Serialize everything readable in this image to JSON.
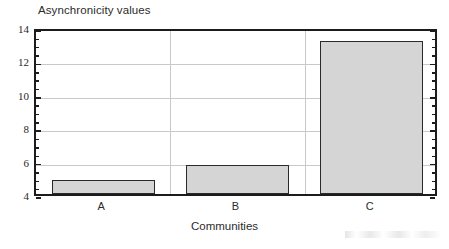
{
  "chart_data": {
    "type": "bar",
    "title": "Asynchronicity values",
    "xlabel": "Communities",
    "ylabel": "",
    "categories": [
      "A",
      "B",
      "C"
    ],
    "values": [
      4.85,
      5.75,
      13.15
    ],
    "series": [
      {
        "name": "Asynchronicity values",
        "values": [
          4.85,
          5.75,
          13.15
        ]
      }
    ],
    "ylim": [
      4,
      14
    ],
    "xlim": [
      0,
      3
    ],
    "y_ticks": [
      4,
      6,
      8,
      10,
      12,
      14
    ],
    "y_tick_labels": [
      "4",
      "6",
      "8",
      "10",
      "12",
      "14"
    ],
    "y_minor_ticks": [
      4.5,
      5,
      5.5,
      6.5,
      7,
      7.5,
      8.5,
      9,
      9.5,
      10.5,
      11,
      11.5,
      12.5,
      13,
      13.5
    ],
    "x_tick_labels": [
      "A",
      "B",
      "C"
    ],
    "grid": {
      "horizontal": true,
      "vertical": true,
      "color": "#c9c9c9"
    },
    "legend": {
      "visible": false,
      "position": "none",
      "entries": []
    },
    "annotations": [],
    "colors": {
      "bar_fill": "#d5d5d5",
      "bar_edge": "#2a2a2a",
      "axis": "#1c1c1c",
      "grid": "#c9c9c9",
      "text": "#2b2b2b",
      "background": "#ffffff"
    }
  }
}
